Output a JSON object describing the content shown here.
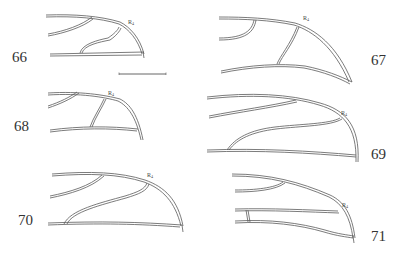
{
  "figure": {
    "panels": [
      {
        "number": "66",
        "vein_label": "R",
        "vein_sub": "4"
      },
      {
        "number": "67",
        "vein_label": "R",
        "vein_sub": "4"
      },
      {
        "number": "68",
        "vein_label": "R",
        "vein_sub": "4"
      },
      {
        "number": "69",
        "vein_label": "R",
        "vein_sub": "4"
      },
      {
        "number": "70",
        "vein_label": "R",
        "vein_sub": "4"
      },
      {
        "number": "71",
        "vein_label": "R",
        "vein_sub": "4"
      }
    ],
    "scale_bar": true,
    "colors": {
      "line": "#5a5a5a",
      "text": "#333333",
      "background": "#ffffff"
    }
  }
}
